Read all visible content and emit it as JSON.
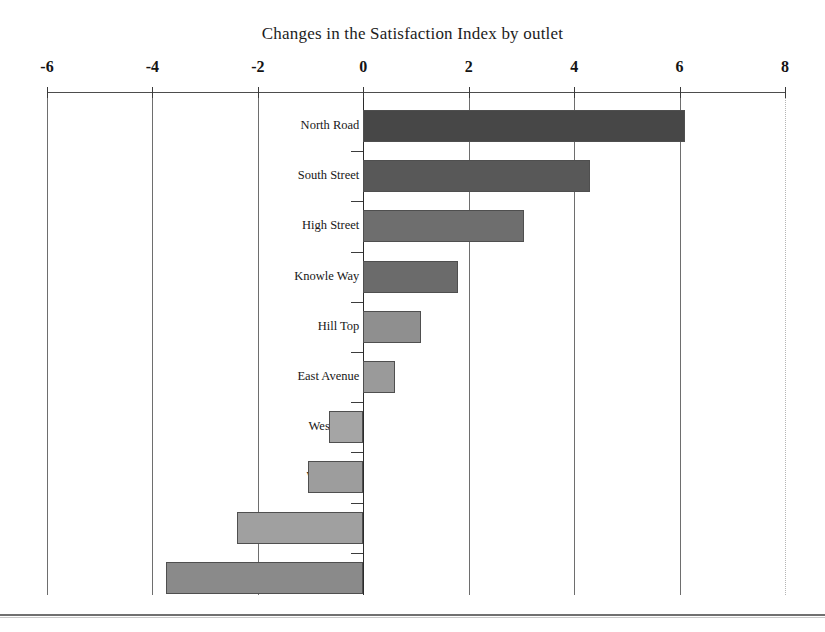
{
  "chart_data": {
    "type": "bar",
    "orientation": "horizontal",
    "title": "Changes in the Satisfaction Index by outlet",
    "xlabel": "",
    "ylabel": "",
    "xlim": [
      -6,
      8
    ],
    "xticks": [
      -6,
      -4,
      -2,
      0,
      2,
      4,
      6,
      8
    ],
    "xtick_labels": [
      "-6",
      "-4",
      "-2",
      "0",
      "2",
      "4",
      "6",
      "8"
    ],
    "grid": true,
    "legend": "none",
    "categories": [
      "North Road",
      "South Street",
      "High Street",
      "Knowle Way",
      "Hill Top",
      "East Avenue",
      "West Park",
      "Wood End",
      "Main Street",
      "Riverbank Walk"
    ],
    "values": [
      6.1,
      4.3,
      3.05,
      1.8,
      1.1,
      0.6,
      -0.65,
      -1.05,
      -2.4,
      -3.75
    ],
    "bar_colors": [
      "#474747",
      "#585858",
      "#6e6e6e",
      "#6b6b6b",
      "#8f8f8f",
      "#9a9a9a",
      "#a5a5a5",
      "#9d9d9d",
      "#a0a0a0",
      "#8a8a8a"
    ]
  },
  "axis": {
    "zero_line_color": "#2b2b2b",
    "grid_color": "#6e6e6e",
    "top_axis_color": "#4d4d4d"
  }
}
